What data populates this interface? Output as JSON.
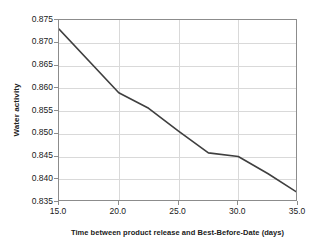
{
  "chart_data": {
    "type": "line",
    "title": "",
    "xlabel": "Time between product release and Best-Before-Date (days)",
    "ylabel": "Water activity",
    "xlim": [
      15.0,
      35.0
    ],
    "ylim": [
      0.835,
      0.875
    ],
    "xticks": [
      "15.0",
      "20.0",
      "25.0",
      "30.0",
      "35.0"
    ],
    "xtick_values": [
      15.0,
      20.0,
      25.0,
      30.0,
      35.0
    ],
    "yticks": [
      "0.835",
      "0.840",
      "0.845",
      "0.850",
      "0.855",
      "0.860",
      "0.865",
      "0.870",
      "0.875"
    ],
    "ytick_values": [
      0.835,
      0.84,
      0.845,
      0.85,
      0.855,
      0.86,
      0.865,
      0.87,
      0.875
    ],
    "grid": true,
    "grid_color": "#d9d9d9",
    "legend": null,
    "series": [
      {
        "name": "Water activity",
        "color": "#3f3f3f",
        "line_width": 1.6,
        "x": [
          15.0,
          20.0,
          22.5,
          25.0,
          27.5,
          30.0,
          32.5,
          35.0
        ],
        "values": [
          0.873,
          0.859,
          0.8556,
          0.8506,
          0.8458,
          0.845,
          0.8412,
          0.837
        ]
      }
    ]
  },
  "axes": {
    "border_color": "#8c8c8c",
    "background": "#ffffff"
  }
}
